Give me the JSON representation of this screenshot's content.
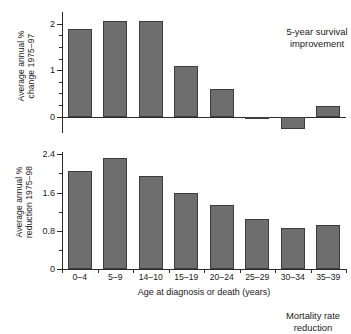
{
  "figure": {
    "xaxis_title": "Age at diagnosis or death (years)",
    "categories": [
      "0–4",
      "5–9",
      "14–10",
      "15–19",
      "20–24",
      "25–29",
      "30–34",
      "35–39"
    ],
    "bar_color": "#6e6e6e",
    "bar_edge_color": "#3d3d3d",
    "axis_color": "#2b2b2b"
  },
  "panels": {
    "top": {
      "annotation": "5-year survival\nimprovement",
      "ylabel": "Average annual %\nchange 1975–97",
      "ticklabels": [
        "0",
        "1",
        "2"
      ]
    },
    "bottom": {
      "annotation": "Mortality rate\nreduction",
      "ylabel": "Average annual %\nreduction 1975–98",
      "ticklabels": [
        "0",
        "0.8",
        "1.6",
        "2.4"
      ]
    }
  },
  "chart_data": [
    {
      "type": "bar",
      "title": "5-year survival improvement",
      "xlabel": "Age at diagnosis or death (years)",
      "ylabel": "Average annual % change 1975–97",
      "categories": [
        "0–4",
        "5–9",
        "14–10",
        "15–19",
        "20–24",
        "25–29",
        "30–34",
        "35–39"
      ],
      "values": [
        1.88,
        2.05,
        2.05,
        1.1,
        0.6,
        -0.03,
        -0.26,
        0.22
      ],
      "ylim": [
        -0.35,
        2.25
      ],
      "yticks": [
        0,
        1,
        2
      ],
      "yticklabels": [
        "0",
        "1",
        "2"
      ],
      "yminorticks": [
        0.25,
        0.5,
        0.75,
        1.25,
        1.5,
        1.75
      ],
      "grid": false,
      "legend": "none"
    },
    {
      "type": "bar",
      "title": "Mortality rate reduction",
      "xlabel": "Age at diagnosis or death (years)",
      "ylabel": "Average annual % reduction 1975–98",
      "categories": [
        "0–4",
        "5–9",
        "14–10",
        "15–19",
        "20–24",
        "25–29",
        "30–34",
        "35–39"
      ],
      "values": [
        2.05,
        2.32,
        1.95,
        1.6,
        1.33,
        1.05,
        0.86,
        0.93
      ],
      "ylim": [
        0,
        2.45
      ],
      "yticks": [
        0,
        0.8,
        1.6,
        2.4
      ],
      "yticklabels": [
        "0",
        "0.8",
        "1.6",
        "2.4"
      ],
      "yminorticks": [
        0.4,
        1.2,
        2.0
      ],
      "grid": false,
      "legend": "none"
    }
  ]
}
